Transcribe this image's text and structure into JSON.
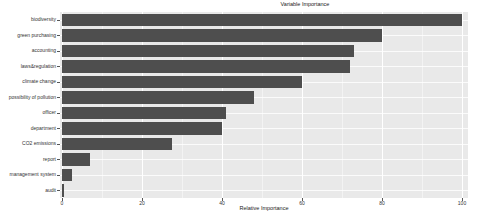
{
  "title": "Variable Importance",
  "chart_data": {
    "type": "bar",
    "orientation": "horizontal",
    "title": "Variable Importance",
    "xlabel": "Relative Importance",
    "categories": [
      "biodiversity",
      "green purchasing",
      "accounting",
      "laws&regulation",
      "climate change",
      "possibility of pollution",
      "officer",
      "department",
      "CO2 emissions",
      "report",
      "management system",
      "audit"
    ],
    "values": [
      100,
      80,
      73,
      72,
      60,
      48,
      41,
      40,
      27.5,
      7,
      2.5,
      0.5
    ],
    "xlim": [
      0,
      100
    ],
    "xticks": [
      0,
      20,
      40,
      60,
      80,
      100
    ],
    "xticks_minor": [
      10,
      30,
      50,
      70,
      90
    ],
    "grid": true,
    "legend": "none",
    "colors": {
      "bar": "#4e4e4e",
      "panel_background": "#e9e9e9",
      "gridline": "#ffffff",
      "text": "#333333",
      "figure_background": "#ffffff"
    }
  }
}
